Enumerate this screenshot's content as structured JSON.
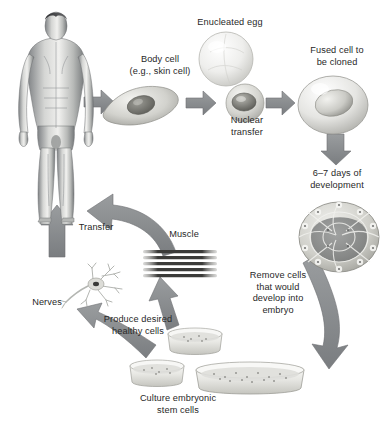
{
  "diagram": {
    "palette": {
      "arrow_fill": "#8a8d8f",
      "arrow_stroke": "#6f7274",
      "text": "#282828",
      "cell_light": "#ededea",
      "cell_mid": "#c9c9c4",
      "cell_dark": "#8d8d88",
      "background": "#ffffff"
    },
    "labels": [
      {
        "id": "body-cell",
        "name": "body-cell-label",
        "text": "Body cell\n(e.g., skin cell)",
        "x": 118,
        "y": 54,
        "w": 84
      },
      {
        "id": "enucleated-egg",
        "name": "enucleated-egg-label",
        "text": "Enucleated egg",
        "x": 184,
        "y": 17,
        "w": 92
      },
      {
        "id": "fused-cell",
        "name": "fused-cell-label",
        "text": "Fused cell to\nbe cloned",
        "x": 296,
        "y": 45,
        "w": 82
      },
      {
        "id": "nuclear-transfer",
        "name": "nuclear-transfer-label",
        "text": "Nuclear\ntransfer",
        "x": 218,
        "y": 115,
        "w": 58
      },
      {
        "id": "days",
        "name": "development-time-label",
        "text": "6–7 days of\ndevelopment",
        "x": 296,
        "y": 168,
        "w": 82
      },
      {
        "id": "remove-cells",
        "name": "remove-cells-label",
        "text": "Remove cells\nthat would\ndevelop into\nembryo",
        "x": 238,
        "y": 270,
        "w": 80
      },
      {
        "id": "transfer",
        "name": "transfer-label",
        "text": "Transfer",
        "x": 68,
        "y": 222,
        "w": 56
      },
      {
        "id": "muscle",
        "name": "muscle-label",
        "text": "Muscle",
        "x": 160,
        "y": 229,
        "w": 48
      },
      {
        "id": "nerves",
        "name": "nerves-label",
        "text": "Nerves",
        "x": 22,
        "y": 297,
        "w": 50
      },
      {
        "id": "produce-cells",
        "name": "produce-healthy-cells-label",
        "text": "Produce desired\nhealthy cells",
        "x": 92,
        "y": 314,
        "w": 92
      },
      {
        "id": "culture",
        "name": "culture-stem-cells-caption",
        "text": "Culture embryonic\nstem cells",
        "x": 130,
        "y": 393,
        "w": 96
      }
    ],
    "figures": [
      {
        "id": "human",
        "name": "human-body-figure",
        "alt": "Standing human male body"
      },
      {
        "id": "skin-cell",
        "name": "skin-cell-figure",
        "alt": "Flattened body (skin) cell with nucleus"
      },
      {
        "id": "egg",
        "name": "enucleated-egg-figure",
        "alt": "Large pale enucleated egg cell"
      },
      {
        "id": "donor",
        "name": "donor-nucleus-cell-figure",
        "alt": "Small cell donating nucleus"
      },
      {
        "id": "fused",
        "name": "fused-cell-figure",
        "alt": "Fused cell to be cloned with nucleus"
      },
      {
        "id": "blastocyst",
        "name": "blastocyst-figure",
        "alt": "Blastocyst, ball of cells after 6-7 days"
      },
      {
        "id": "muscle",
        "name": "muscle-fibers-figure",
        "alt": "Striated muscle fibers"
      },
      {
        "id": "neuron",
        "name": "neuron-figure",
        "alt": "Nerve cell / neuron with dendrites and axon"
      },
      {
        "id": "dish-a",
        "name": "petri-dish-small-upper",
        "alt": "Small petri dish with cells"
      },
      {
        "id": "dish-b",
        "name": "petri-dish-small-left",
        "alt": "Small petri dish with cells"
      },
      {
        "id": "dish-c",
        "name": "petri-dish-large",
        "alt": "Large petri dish with cultured stem cells"
      }
    ],
    "arrows": [
      {
        "id": "a1",
        "name": "arrow-body-to-skin-cell",
        "from": "human",
        "to": "skin-cell"
      },
      {
        "id": "a2",
        "name": "arrow-skin-cell-to-egg",
        "from": "skin-cell",
        "to": "donor"
      },
      {
        "id": "a3",
        "name": "arrow-egg-to-fused-cell",
        "from": "donor",
        "to": "fused"
      },
      {
        "id": "a4",
        "name": "arrow-fused-cell-to-blastocyst",
        "from": "fused",
        "to": "blastocyst"
      },
      {
        "id": "a5",
        "name": "arrow-blastocyst-to-dish",
        "from": "blastocyst",
        "to": "dish-c"
      },
      {
        "id": "a6",
        "name": "arrow-dish-to-produce-cells",
        "from": "dish-b",
        "to": "neuron"
      },
      {
        "id": "a7",
        "name": "arrow-dish-to-muscle",
        "from": "dish-a",
        "to": "muscle"
      },
      {
        "id": "a8",
        "name": "arrow-nerves-to-body",
        "from": "neuron",
        "to": "human"
      },
      {
        "id": "a9",
        "name": "arrow-muscle-transfer-to-body",
        "from": "muscle",
        "to": "human"
      }
    ]
  }
}
